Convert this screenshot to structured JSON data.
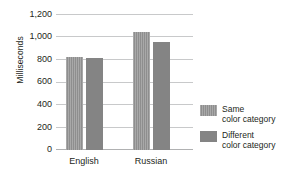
{
  "chart_data": {
    "type": "bar",
    "title": "",
    "xlabel": "",
    "ylabel": "Milliseconds",
    "categories": [
      "English",
      "Russian"
    ],
    "series": [
      {
        "name": "Same color category",
        "values": [
          830,
          1050
        ]
      },
      {
        "name": "Different color category",
        "values": [
          820,
          960
        ]
      }
    ],
    "ylim": [
      0,
      1200
    ],
    "yticks": [
      "0",
      "200",
      "400",
      "600",
      "800",
      "1,000",
      "1,200"
    ],
    "ytick_values": [
      0,
      200,
      400,
      600,
      800,
      1000,
      1200
    ],
    "grid": true,
    "legend_position": "right",
    "colors": {
      "same": "#939393",
      "different": "#848484",
      "gridline": "#c8c9ca",
      "text": "#231f20",
      "background": "#ffffff"
    }
  },
  "legend": {
    "items": [
      {
        "line1": "Same",
        "line2": "color category"
      },
      {
        "line1": "Different",
        "line2": "color category"
      }
    ]
  }
}
